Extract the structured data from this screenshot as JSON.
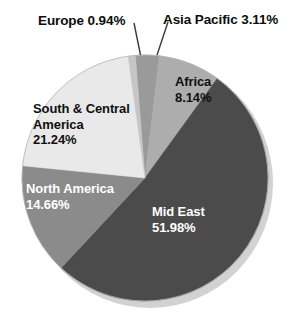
{
  "chart_data": {
    "type": "pie",
    "title": "",
    "subtitle": "",
    "xlabel": "",
    "ylabel": "",
    "legend_position": "none",
    "grid": false,
    "units": "percent",
    "total": 100.07,
    "start_angle_deg": -4.5,
    "direction": "clockwise",
    "categories": [
      "Asia Pacific",
      "Africa",
      "Mid East",
      "North America",
      "South & Central America",
      "Europe"
    ],
    "values": [
      3.11,
      8.14,
      51.98,
      14.66,
      21.24,
      0.94
    ],
    "slices": [
      {
        "name": "Asia Pacific",
        "label": "Asia Pacific 3.11%",
        "value": 3.11,
        "value_text": "3.11%",
        "color": "#9a9a9a",
        "label_placement": "outside",
        "label_color": "#0d0d0d",
        "has_leader_line": true
      },
      {
        "name": "Africa",
        "label": "Africa",
        "value": 8.14,
        "value_text": "8.14%",
        "color": "#adadad",
        "label_placement": "inside",
        "label_color": "#101010",
        "has_leader_line": false
      },
      {
        "name": "Mid East",
        "label": "Mid East",
        "value": 51.98,
        "value_text": "51.98%",
        "color": "#4b4b4b",
        "label_placement": "inside",
        "label_color": "#ffffff",
        "has_leader_line": false
      },
      {
        "name": "North America",
        "label": "North America",
        "value": 14.66,
        "value_text": "14.66%",
        "color": "#8b8b8b",
        "label_placement": "inside",
        "label_color": "#ffffff",
        "has_leader_line": false
      },
      {
        "name": "South & Central America",
        "label_line1": "South & Central",
        "label_line2": "America",
        "value": 21.24,
        "value_text": "21.24%",
        "color": "#e9e9e9",
        "label_placement": "inside",
        "label_color": "#101010",
        "has_leader_line": false
      },
      {
        "name": "Europe",
        "label": "Europe 0.94%",
        "value": 0.94,
        "value_text": "0.94%",
        "color": "#c6c6c6",
        "label_placement": "outside",
        "label_color": "#0d0d0d",
        "has_leader_line": true
      }
    ],
    "palette": {
      "background": "#ffffff",
      "shadow": "#cfcfcf",
      "outline": "#b4b4b4",
      "leader_line": "#3a3a3a"
    },
    "geometry": {
      "center_x": 145,
      "center_y": 178,
      "radius": 123
    }
  },
  "labels": {
    "europe": "Europe 0.94%",
    "asia_pacific": "Asia Pacific 3.11%",
    "africa_name": "Africa",
    "africa_value": "8.14%",
    "mid_east_name": "Mid East",
    "mid_east_value": "51.98%",
    "north_america_name": "North America",
    "north_america_value": "14.66%",
    "south_central_line1": "South & Central",
    "south_central_line2": "America",
    "south_central_value": "21.24%"
  }
}
